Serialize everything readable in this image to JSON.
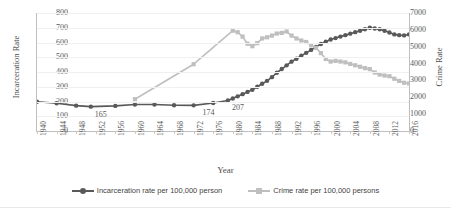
{
  "chart_data": {
    "type": "line",
    "title": "",
    "xlabel": "Year",
    "ylabel": "Incarceration Rate",
    "y2label": "Crime Rate",
    "grid": true,
    "legend_position": "bottom",
    "xlim": [
      1940,
      2016
    ],
    "ylim": [
      0,
      800
    ],
    "y2lim": [
      0,
      7000
    ],
    "xticks": [
      "1940",
      "1944",
      "1948",
      "1952",
      "1956",
      "1960",
      "1964",
      "1968",
      "1972",
      "1976",
      "1980",
      "1984",
      "1988",
      "1992",
      "1996",
      "2000",
      "2004",
      "2008",
      "2012",
      "2016"
    ],
    "yticks_left": [
      "0",
      "100",
      "200",
      "300",
      "400",
      "500",
      "600",
      "700",
      "800"
    ],
    "yticks_right": [
      "0",
      "1000",
      "2000",
      "3000",
      "4000",
      "5000",
      "6000",
      "7000"
    ],
    "annotations": [
      {
        "text": "165",
        "x": 1951,
        "y": 165
      },
      {
        "text": "174",
        "x": 1973,
        "y": 174
      },
      {
        "text": "207",
        "x": 1979,
        "y": 207
      }
    ],
    "series": [
      {
        "name": "Incarceration rate per 100,000 person",
        "axis": "left",
        "color": "#595959",
        "marker": "circle",
        "x": [
          1940,
          1944,
          1948,
          1951,
          1956,
          1960,
          1964,
          1968,
          1972,
          1976,
          1979,
          1980,
          1981,
          1982,
          1983,
          1984,
          1985,
          1986,
          1987,
          1988,
          1989,
          1990,
          1991,
          1992,
          1993,
          1994,
          1995,
          1996,
          1997,
          1998,
          1999,
          2000,
          2001,
          2002,
          2003,
          2004,
          2005,
          2006,
          2007,
          2008,
          2009,
          2010,
          2011,
          2012,
          2013,
          2014,
          2015,
          2016
        ],
        "values": [
          198,
          188,
          172,
          165,
          170,
          180,
          180,
          175,
          174,
          190,
          207,
          220,
          235,
          250,
          265,
          280,
          300,
          320,
          340,
          365,
          395,
          420,
          445,
          470,
          490,
          510,
          530,
          550,
          570,
          590,
          605,
          620,
          630,
          640,
          650,
          660,
          670,
          680,
          690,
          700,
          695,
          690,
          680,
          668,
          655,
          650,
          648,
          655
        ]
      },
      {
        "name": "Crime rate per 100,000 persons",
        "axis": "right",
        "color": "#bfbfbf",
        "marker": "square",
        "x": [
          1960,
          1972,
          1980,
          1981,
          1982,
          1983,
          1984,
          1985,
          1986,
          1987,
          1988,
          1989,
          1990,
          1991,
          1992,
          1993,
          1994,
          1995,
          1996,
          1997,
          1998,
          1999,
          2000,
          2001,
          2002,
          2003,
          2004,
          2005,
          2006,
          2007,
          2008,
          2009,
          2010,
          2011,
          2012,
          2013,
          2014,
          2015,
          2016
        ],
        "values": [
          1887,
          3961,
          5950,
          5860,
          5600,
          5180,
          5030,
          5210,
          5490,
          5560,
          5660,
          5780,
          5820,
          5900,
          5660,
          5490,
          5370,
          5280,
          5090,
          4930,
          4620,
          4270,
          4120,
          4160,
          4120,
          4070,
          3980,
          3900,
          3810,
          3730,
          3670,
          3470,
          3350,
          3290,
          3250,
          3100,
          2970,
          2860,
          2820
        ]
      }
    ]
  }
}
